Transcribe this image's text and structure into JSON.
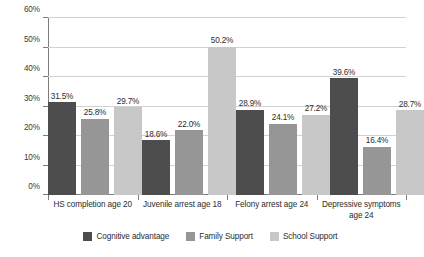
{
  "chart_data": {
    "type": "bar",
    "title": "",
    "xlabel": "",
    "ylabel": "",
    "ylim": [
      0,
      60
    ],
    "ytick_labels": [
      "60%",
      "50%",
      "40%",
      "30%",
      "20%",
      "10%",
      "0%"
    ],
    "ytick_values": [
      60,
      50,
      40,
      30,
      20,
      10,
      0
    ],
    "grid": true,
    "legend_position": "bottom",
    "categories": [
      "HS completion age 20",
      "Juvenile arrest age 18",
      "Felony arrest age 24",
      "Depressive symptoms\nage 24"
    ],
    "series": [
      {
        "name": "Cognitive advantage",
        "color": "#4d4d4d",
        "values": [
          31.5,
          18.6,
          28.9,
          39.6
        ],
        "labels": [
          "31.5%",
          "18.6%",
          "28.9%",
          "39.6%"
        ]
      },
      {
        "name": "Family Support",
        "color": "#969696",
        "values": [
          25.8,
          22.0,
          24.1,
          16.4
        ],
        "labels": [
          "25.8%",
          "22.0%",
          "24.1%",
          "16.4%"
        ]
      },
      {
        "name": "School Support",
        "color": "#c8c8c8",
        "values": [
          29.7,
          50.2,
          27.2,
          28.7
        ],
        "labels": [
          "29.7%",
          "50.2%",
          "27.2%",
          "28.7%"
        ]
      }
    ]
  }
}
